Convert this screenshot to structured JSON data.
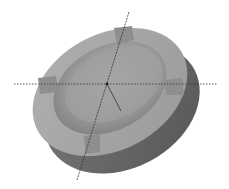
{
  "scene": {
    "subject": "ashtray-3d-model",
    "background": "#ffffff",
    "colors": {
      "rim_top": "#a6a6a6",
      "rim_light": "#b4b4b4",
      "side_wall": "#6f6f6f",
      "side_dark": "#5a5a5a",
      "bowl": "#9c9c9c",
      "bowl_shadow": "#7e7e7e",
      "notch": "#8c8c8c",
      "axis_line": "#333333"
    },
    "notches": 4,
    "axes": [
      "horizontal",
      "diagonal",
      "short-diagonal"
    ]
  }
}
